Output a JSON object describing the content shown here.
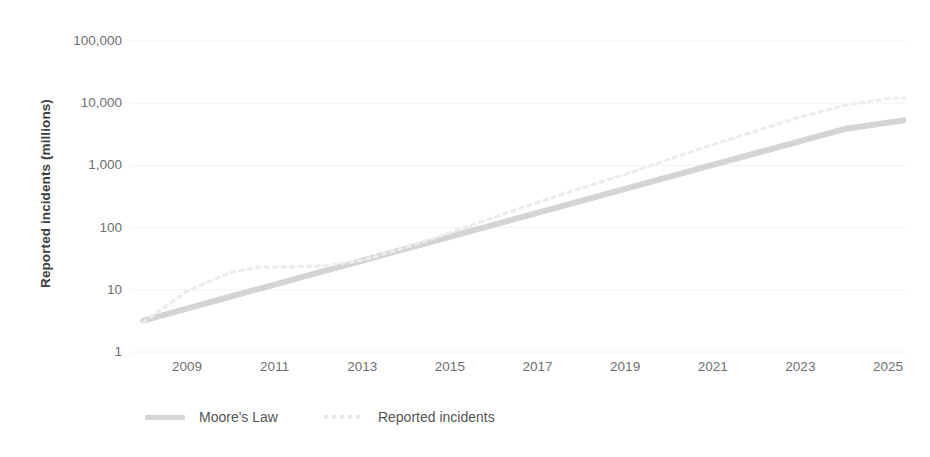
{
  "chart_data": {
    "type": "line",
    "title": "",
    "xlabel": "",
    "ylabel": "Reported incidents (millions)",
    "yscale": "log",
    "ylim": [
      1,
      100000
    ],
    "xlim": [
      2008,
      2025.6
    ],
    "grid": true,
    "legend_position": "bottom-left",
    "ytick_labels": [
      "100,000",
      "10,000",
      "1,000",
      "100",
      "10",
      "1"
    ],
    "ytick_values": [
      100000,
      10000,
      1000,
      100,
      10,
      1
    ],
    "xtick_labels": [
      "2009",
      "2011",
      "2013",
      "2015",
      "2017",
      "2019",
      "2021",
      "2023",
      "2025"
    ],
    "xtick_values": [
      2009,
      2011,
      2013,
      2015,
      2017,
      2019,
      2021,
      2023,
      2025
    ],
    "series": [
      {
        "name": "Moore's Law",
        "style": "solid",
        "color": "#d4d4d4",
        "x": [
          2008.0,
          2009.0,
          2010.0,
          2011.0,
          2012.0,
          2013.0,
          2014.0,
          2015.0,
          2016.0,
          2017.0,
          2018.0,
          2019.0,
          2020.0,
          2021.0,
          2022.0,
          2023.0,
          2024.0,
          2025.5
        ],
        "y": [
          3.2,
          5.0,
          7.8,
          12.1,
          18.9,
          29.4,
          45.8,
          71.3,
          111,
          173,
          269,
          419,
          652,
          1016,
          1582,
          2463,
          3836,
          5500
        ]
      },
      {
        "name": "Reported incidents",
        "style": "dotted",
        "color": "#ececec",
        "x": [
          2008.0,
          2009.0,
          2010.0,
          2010.6,
          2011.5,
          2012.2,
          2013.0,
          2014.0,
          2015.0,
          2016.0,
          2017.0,
          2018.0,
          2019.0,
          2020.0,
          2021.0,
          2022.0,
          2023.0,
          2024.0,
          2025.0,
          2025.5
        ],
        "y": [
          3.0,
          9.5,
          19.0,
          23.0,
          23.5,
          24.5,
          30.0,
          48.0,
          82.0,
          145.0,
          255.0,
          430.0,
          720.0,
          1250.0,
          2150.0,
          3600.0,
          6000.0,
          9200.0,
          11800.0,
          12300.0
        ]
      }
    ]
  },
  "legend": {
    "items": [
      {
        "label": "Moore's Law",
        "swatch": "solid-line-swatch"
      },
      {
        "label": "Reported incidents",
        "swatch": "dotted-line-swatch"
      }
    ]
  },
  "colors": {
    "grid": "#f2f2f2",
    "tick_text": "#6f6f6f",
    "axis_title": "#3d3d3d",
    "legend_text": "#555555",
    "series_moores_law": "#d4d4d4",
    "series_reported_incidents": "#ececec",
    "background": "#ffffff"
  }
}
